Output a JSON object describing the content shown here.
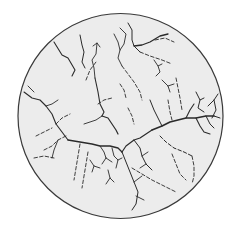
{
  "figure": {
    "canvas": {
      "width": 238,
      "height": 229,
      "background": "#ffffff"
    },
    "disc": {
      "cx": 120.5,
      "cy": 116,
      "r": 102.5,
      "fill": "#ececec",
      "stroke": "#3a3a3a",
      "stroke_width": 1.2
    },
    "crack_color": "#2a2a2a",
    "cracks": [
      {
        "id": "c1",
        "style": "solid",
        "w": 1.1,
        "d": "M54 42 L62 55 L68 58 L75 70 L72 76"
      },
      {
        "id": "c2",
        "style": "solid",
        "w": 1.0,
        "d": "M80 35 L82 45 L84 52 L82 62 L85 68"
      },
      {
        "id": "c3",
        "style": "solid",
        "w": 0.9,
        "d": "M93 46 L97 43 L100 47 M97 43 L96 54 L92 60 L94 68 L95 78"
      },
      {
        "id": "c4",
        "style": "solid",
        "w": 1.1,
        "d": "M95 78 L98 92 L100 104 L104 112 L102 116"
      },
      {
        "id": "c5",
        "style": "solid",
        "w": 1.2,
        "d": "M102 116 L108 118 L112 124 L116 130 L118 134"
      },
      {
        "id": "c6",
        "style": "dashed",
        "w": 0.9,
        "d": "M86 80 L90 70 L96 62"
      },
      {
        "id": "c7",
        "style": "solid",
        "w": 1.0,
        "d": "M128 23 L132 30 L132 40 L134 46 L140 52"
      },
      {
        "id": "c8",
        "style": "solid",
        "w": 1.3,
        "d": "M134 46 L142 45 L150 42 L160 36 L168 34"
      },
      {
        "id": "c9",
        "style": "dashed",
        "w": 0.9,
        "d": "M140 52 L150 56 L162 60 L172 64"
      },
      {
        "id": "c10",
        "style": "solid",
        "w": 0.9,
        "d": "M120 28 L126 34 L124 44 L120 50 L118 58 L122 66"
      },
      {
        "id": "c11",
        "style": "solid",
        "w": 0.9,
        "d": "M114 34 L118 42 L120 50"
      },
      {
        "id": "c12",
        "style": "dashed",
        "w": 0.9,
        "d": "M155 40 L165 38 L174 42"
      },
      {
        "id": "c13",
        "style": "solid",
        "w": 0.9,
        "d": "M154 60 L158 66 L162 64 M158 66 L160 72 L156 76"
      },
      {
        "id": "c14",
        "style": "dashed",
        "w": 0.9,
        "d": "M122 66 L128 74 L134 82 L140 92 L142 100"
      },
      {
        "id": "c15",
        "style": "dashed",
        "w": 0.9,
        "d": "M176 78 L178 88 L180 98 L182 110"
      },
      {
        "id": "c16",
        "style": "solid",
        "w": 1.0,
        "d": "M196 92 L200 100 L204 98 M200 100 L198 108 L204 112"
      },
      {
        "id": "c17",
        "style": "solid",
        "w": 1.0,
        "d": "M208 106 L214 100 L218 94 M214 100 L216 110 L212 118"
      },
      {
        "id": "c18",
        "style": "solid",
        "w": 1.6,
        "d": "M152 130 L162 126 L170 122 L178 120 L186 118 L196 118 L206 116 L214 116"
      },
      {
        "id": "c19",
        "style": "solid",
        "w": 1.1,
        "d": "M186 118 L190 110 L194 104 M196 118 L200 126 L204 132 L210 134"
      },
      {
        "id": "c20",
        "style": "solid",
        "w": 1.0,
        "d": "M206 116 L210 124 L214 128 M214 116 L220 118"
      },
      {
        "id": "c21",
        "style": "solid",
        "w": 1.2,
        "d": "M152 130 L146 134 L140 138 L134 140 L126 146 L122 152"
      },
      {
        "id": "c22",
        "style": "solid",
        "w": 1.0,
        "d": "M150 100 L154 110 L158 118 L162 126"
      },
      {
        "id": "c23",
        "style": "dashed",
        "w": 0.9,
        "d": "M168 100 L170 112 L172 120"
      },
      {
        "id": "c24",
        "style": "dashed",
        "w": 1.0,
        "d": "M160 136 L166 142 L174 148 L184 152 L192 156"
      },
      {
        "id": "c25",
        "style": "dashed",
        "w": 0.9,
        "d": "M172 154 L176 164 L180 174 L186 180"
      },
      {
        "id": "c26",
        "style": "dashed",
        "w": 0.9,
        "d": "M192 156 L194 166 L194 176 L192 184"
      },
      {
        "id": "c27",
        "style": "dashed",
        "w": 0.9,
        "d": "M132 168 L142 174 L152 180 L164 186 L176 192"
      },
      {
        "id": "c28",
        "style": "solid",
        "w": 1.0,
        "d": "M122 152 L126 162 L130 172 L134 182 L138 192 L136 204 L132 210"
      },
      {
        "id": "c29",
        "style": "solid",
        "w": 0.9,
        "d": "M134 182 L142 176 M136 196 L144 200"
      },
      {
        "id": "c30",
        "style": "solid",
        "w": 1.3,
        "d": "M68 140 L80 142 L92 144 L100 146 L110 146 L118 148 L122 152"
      },
      {
        "id": "c31",
        "style": "solid",
        "w": 0.9,
        "d": "M100 146 L104 152 L106 158 M106 158 L102 164 M106 158 L112 162"
      },
      {
        "id": "c32",
        "style": "solid",
        "w": 0.9,
        "d": "M112 148 L114 156 L118 160 L116 168 M118 160 L122 158"
      },
      {
        "id": "c33",
        "style": "solid",
        "w": 0.9,
        "d": "M90 160 L94 166 L100 168 M94 166 L92 172"
      },
      {
        "id": "c34",
        "style": "solid",
        "w": 0.9,
        "d": "M108 170 L110 178 L114 182 M110 178 L106 184"
      },
      {
        "id": "c35",
        "style": "dashed",
        "w": 0.9,
        "d": "M80 144 L78 156 L76 168 L74 180"
      },
      {
        "id": "c36",
        "style": "dashed",
        "w": 0.9,
        "d": "M88 152 L86 164 L84 176 L82 188"
      },
      {
        "id": "c37",
        "style": "solid",
        "w": 1.1,
        "d": "M24 92 L32 98 L40 100 L46 106 L52 114 L56 124 L62 132 L68 140"
      },
      {
        "id": "c38",
        "style": "solid",
        "w": 0.9,
        "d": "M28 86 L34 92 M46 106 L52 104 L58 100"
      },
      {
        "id": "c39",
        "style": "dashed",
        "w": 0.9,
        "d": "M56 124 L62 118 L70 114"
      },
      {
        "id": "c40",
        "style": "dashed",
        "w": 0.9,
        "d": "M36 136 L44 132 L52 128"
      },
      {
        "id": "c41",
        "style": "dashed",
        "w": 0.9,
        "d": "M44 150 L52 146 L58 140 L66 136"
      },
      {
        "id": "c42",
        "style": "dashed",
        "w": 0.9,
        "d": "M34 158 L44 156 L54 158"
      },
      {
        "id": "c43",
        "style": "solid",
        "w": 0.9,
        "d": "M58 140 L54 150 L52 158"
      },
      {
        "id": "c44",
        "style": "solid",
        "w": 1.0,
        "d": "M134 140 L140 148 L142 156 L146 164 L152 170"
      },
      {
        "id": "c45",
        "style": "solid",
        "w": 0.9,
        "d": "M142 156 L148 152 M146 164 L140 168"
      },
      {
        "id": "c46",
        "style": "dashed",
        "w": 0.9,
        "d": "M98 104 L104 100 L112 98"
      },
      {
        "id": "c47",
        "style": "solid",
        "w": 0.9,
        "d": "M102 116 L96 120 L90 122 L84 124"
      },
      {
        "id": "c48",
        "style": "dashed",
        "w": 0.9,
        "d": "M128 108 L132 116 L134 124"
      },
      {
        "id": "c49",
        "style": "solid",
        "w": 0.9,
        "d": "M162 80 L168 86 L170 92 M168 86 L174 84"
      },
      {
        "id": "c50",
        "style": "dashed",
        "w": 0.9,
        "d": "M120 84 L124 90 L126 98"
      }
    ]
  }
}
